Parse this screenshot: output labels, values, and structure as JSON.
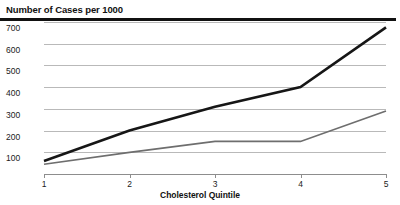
{
  "chart_data": {
    "type": "line",
    "title": "Number of Cases per 1000",
    "xlabel": "Cholesterol Quintile",
    "ylabel": "",
    "categories": [
      "1",
      "2",
      "3",
      "4",
      "5"
    ],
    "x": [
      1,
      2,
      3,
      4,
      5
    ],
    "xlim": [
      1,
      5
    ],
    "ylim": [
      0,
      700
    ],
    "yticks": [
      100,
      200,
      300,
      400,
      500,
      600,
      700
    ],
    "ytick_labels": [
      "100",
      "200",
      "300",
      "400",
      "500",
      "600",
      "700"
    ],
    "xtick_labels": [
      "1",
      "2",
      "3",
      "4",
      "5"
    ],
    "grid": "horizontal",
    "legend": "none",
    "series": [
      {
        "name": "upper-line",
        "color": "#161616",
        "width": 2.6,
        "values": [
          60,
          200,
          310,
          400,
          675
        ]
      },
      {
        "name": "lower-line",
        "color": "#6e6e6e",
        "width": 1.7,
        "values": [
          45,
          100,
          150,
          150,
          290
        ]
      }
    ]
  },
  "figure": {
    "title": "Number of Cases per 1000",
    "xaxis_title": "Cholesterol Quintile",
    "background": "#ffffff",
    "rule_color": "#111111",
    "grid_color": "#b9b9b9",
    "axis_color": "#8d8d8d"
  }
}
